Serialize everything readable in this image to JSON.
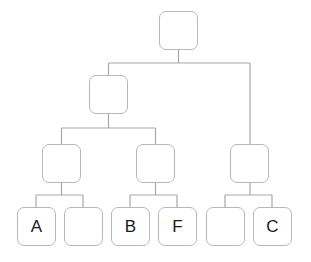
{
  "diagram": {
    "type": "tree",
    "line_color": "#a8a8a8",
    "box_border_color": "#b8b8b8",
    "nodes": [
      {
        "id": "root",
        "label": "",
        "x": 159,
        "y": 11
      },
      {
        "id": "l1-left",
        "label": "",
        "x": 89,
        "y": 75
      },
      {
        "id": "l2-a",
        "label": "",
        "x": 42,
        "y": 144
      },
      {
        "id": "l2-b",
        "label": "",
        "x": 136,
        "y": 144
      },
      {
        "id": "l2-right",
        "label": "",
        "x": 230,
        "y": 144
      },
      {
        "id": "leaf-a",
        "label": "A",
        "x": 17,
        "y": 207
      },
      {
        "id": "leaf-blank-1",
        "label": "",
        "x": 64,
        "y": 207
      },
      {
        "id": "leaf-b",
        "label": "B",
        "x": 111,
        "y": 207
      },
      {
        "id": "leaf-f",
        "label": "F",
        "x": 158,
        "y": 207
      },
      {
        "id": "leaf-blank-2",
        "label": "",
        "x": 206,
        "y": 207
      },
      {
        "id": "leaf-c",
        "label": "C",
        "x": 253,
        "y": 207
      }
    ],
    "edges": [
      [
        "root",
        "l1-left"
      ],
      [
        "root",
        "l2-right"
      ],
      [
        "l1-left",
        "l2-a"
      ],
      [
        "l1-left",
        "l2-b"
      ],
      [
        "l2-a",
        "leaf-a"
      ],
      [
        "l2-a",
        "leaf-blank-1"
      ],
      [
        "l2-b",
        "leaf-b"
      ],
      [
        "l2-b",
        "leaf-f"
      ],
      [
        "l2-right",
        "leaf-blank-2"
      ],
      [
        "l2-right",
        "leaf-c"
      ]
    ]
  }
}
